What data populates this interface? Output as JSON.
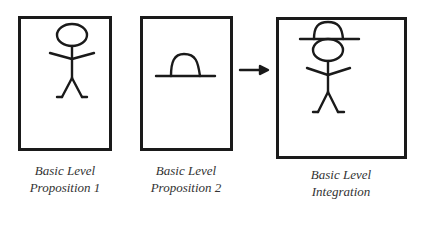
{
  "diagram": {
    "panels": [
      {
        "id": "p1",
        "caption_line1": "Basic Level",
        "caption_line2": "Proposition 1",
        "content": "stick-figure"
      },
      {
        "id": "p2",
        "caption_line1": "Basic Level",
        "caption_line2": "Proposition 2",
        "content": "hat"
      },
      {
        "id": "p3",
        "caption_line1": "Basic Level",
        "caption_line2": "Integration",
        "content": "stick-figure-wearing-hat"
      }
    ],
    "arrow": {
      "from": "p2",
      "to": "p3",
      "icon": "right-arrow-icon"
    },
    "colors": {
      "stroke": "#1a1a1a",
      "caption": "#333333",
      "background": "#ffffff"
    }
  }
}
